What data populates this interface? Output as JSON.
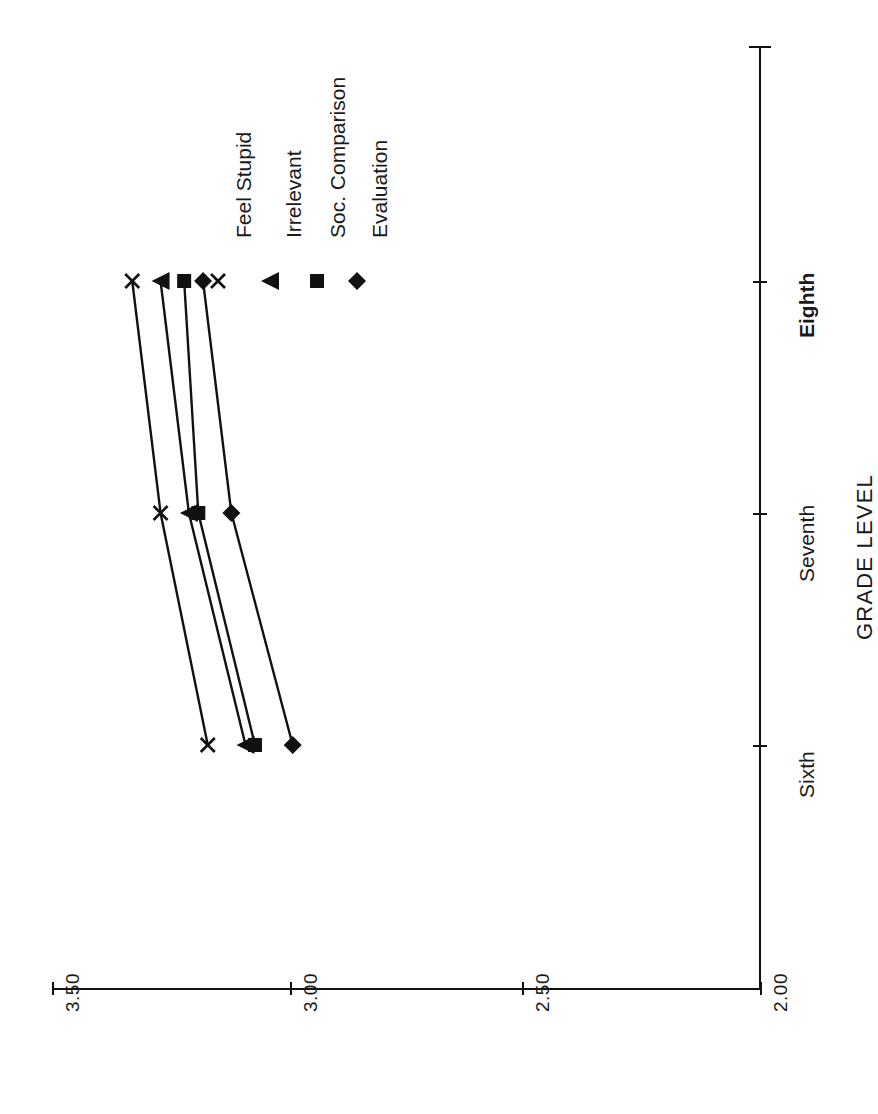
{
  "chart_data": {
    "type": "line",
    "title": "",
    "orientation": "rotated-90-ccw",
    "categories": [
      "Sixth",
      "Seventh",
      "Eighth"
    ],
    "category_axis_label": "GRADE LEVEL",
    "category_axis_bold_tick": "Eighth",
    "value_axis_label": "",
    "value_ticks": [
      "3.50",
      "3.00",
      "2.50",
      "2.00"
    ],
    "value_tick_values": [
      3.5,
      3.0,
      2.5,
      2.0
    ],
    "ylim": [
      2.0,
      3.5
    ],
    "value_axis_direction": "decreasing-left-to-right",
    "grid": false,
    "legend_position": "inside-top-left-rotated",
    "series": [
      {
        "name": "Feel Stupid",
        "marker": "x",
        "values": [
          3.17,
          3.27,
          3.33
        ]
      },
      {
        "name": "Irrelevant",
        "marker": "triangle",
        "values": [
          3.09,
          3.21,
          3.27
        ]
      },
      {
        "name": "Soc. Comparison",
        "marker": "square",
        "values": [
          3.07,
          3.19,
          3.22
        ]
      },
      {
        "name": "Evaluation",
        "marker": "diamond",
        "values": [
          2.99,
          3.12,
          3.18
        ]
      }
    ],
    "colors": {
      "line": "#111111",
      "marker": "#111111",
      "axis": "#111111",
      "background": "#ffffff"
    }
  },
  "value_tick_labels": {
    "t0": "3.50",
    "t1": "3.00",
    "t2": "2.50",
    "t3": "2.00"
  },
  "category_tick_labels": {
    "sixth": "Sixth",
    "seventh": "Seventh",
    "eighth": "Eighth"
  },
  "axis_title": "GRADE LEVEL",
  "legend": {
    "items": [
      {
        "label": "Feel Stupid",
        "marker": "x-marker"
      },
      {
        "label": "Irrelevant",
        "marker": "triangle-marker"
      },
      {
        "label": "Soc. Comparison",
        "marker": "square-marker"
      },
      {
        "label": "Evaluation",
        "marker": "diamond-marker"
      }
    ]
  }
}
